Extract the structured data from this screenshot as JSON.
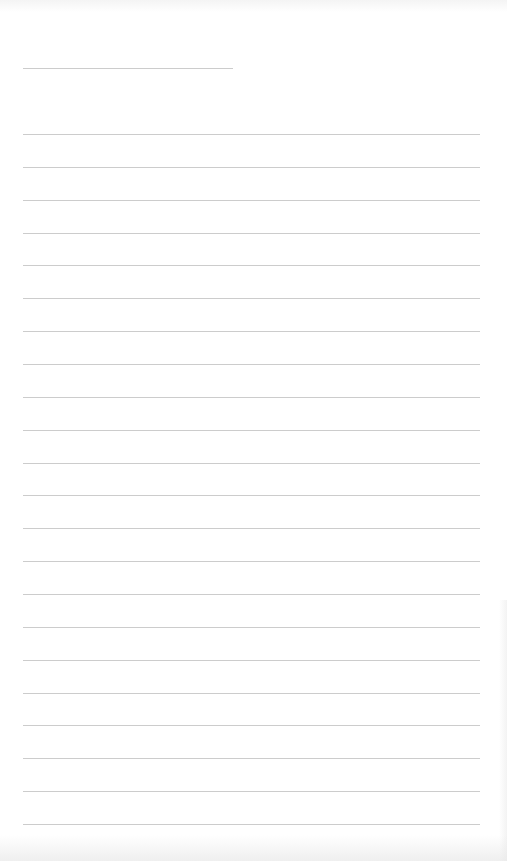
{
  "document": {
    "type": "lined paper",
    "background_color": "#ffffff",
    "line_color": "#cccccc",
    "title_line": {
      "y": 68,
      "x_start": 23,
      "x_end": 233
    },
    "ruled_lines": {
      "count": 22,
      "first_y": 134,
      "spacing": 32.86,
      "x_start": 23,
      "x_end": 480
    }
  }
}
